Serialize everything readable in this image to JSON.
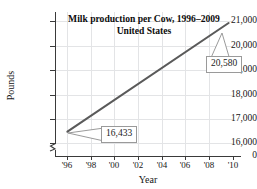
{
  "chart_data": {
    "type": "line",
    "title": "Milk production per Cow, 1996–2009",
    "subtitle": "United States",
    "xlabel": "Year",
    "ylabel": "Pounds",
    "x": [
      1996,
      2009
    ],
    "values": [
      16433,
      20580
    ],
    "series": [
      {
        "name": "Milk production per cow",
        "values": [
          16433,
          20580
        ]
      }
    ],
    "xlim": [
      1995,
      2010
    ],
    "ylim": [
      16000,
      21000
    ],
    "y_axis_break": true,
    "y_zero_tick": "0",
    "grid": true,
    "legend": "none",
    "line_color": "#5a5a5a",
    "xticks": [
      {
        "value": 1996,
        "label": "'96"
      },
      {
        "value": 1998,
        "label": "'98"
      },
      {
        "value": 2000,
        "label": "'00"
      },
      {
        "value": 2002,
        "label": "'02"
      },
      {
        "value": 2004,
        "label": "'04"
      },
      {
        "value": 2006,
        "label": "'06"
      },
      {
        "value": 2008,
        "label": "'08"
      },
      {
        "value": 2010,
        "label": "'10"
      }
    ],
    "yticks": [
      {
        "value": 21000,
        "label": "21,000"
      },
      {
        "value": 20000,
        "label": "20,000"
      },
      {
        "value": 19000,
        "label": "19,000"
      },
      {
        "value": 18000,
        "label": "18,000"
      },
      {
        "value": 17000,
        "label": "17,000"
      },
      {
        "value": 16000,
        "label": "16,000"
      },
      {
        "value": 0,
        "label": "0"
      }
    ],
    "annotations": [
      {
        "label": "16,433",
        "x": 1996,
        "y": 16433
      },
      {
        "label": "20,580",
        "x": 2009,
        "y": 20580
      }
    ]
  }
}
